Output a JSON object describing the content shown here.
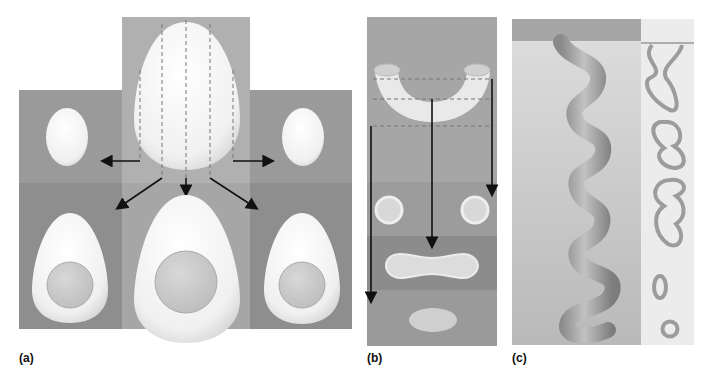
{
  "panels": {
    "a": {
      "label": "(a)",
      "subject": "egg-serial-sections"
    },
    "b": {
      "label": "(b)",
      "subject": "bent-tube-serial-sections"
    },
    "c": {
      "label": "(c)",
      "subject": "coiled-tube-serial-section"
    }
  },
  "colors": {
    "background": "#ffffff",
    "panel_gray": "#9a9a9a",
    "panel_gray_light": "#b4b4b4",
    "panel_gray_dark": "#8c8c8c",
    "egg_white": "#f4f4f4",
    "yolk": "#c8c8c8",
    "tube": "#a8a8a8",
    "slice_line": "#888888",
    "arrow": "#111111",
    "section_bg": "#e6e6e6"
  }
}
